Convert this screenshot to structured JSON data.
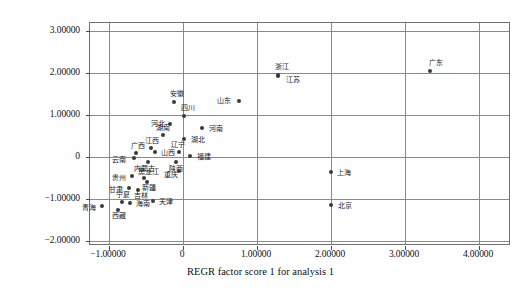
{
  "chart_data": {
    "type": "scatter",
    "title": "",
    "xlabel": "REGR factor score 1 for analysis 1",
    "ylabel": "REGR factor score 2 for analysis 1",
    "xlim": [
      -1.4,
      4.45
    ],
    "ylim": [
      -2.3,
      3.45
    ],
    "grid": true,
    "legend": null,
    "xticks": [
      {
        "value": -1,
        "label": "−1.00000"
      },
      {
        "value": 0,
        "label": "0"
      },
      {
        "value": 1,
        "label": "1.00000"
      },
      {
        "value": 2,
        "label": "2.00000"
      },
      {
        "value": 3,
        "label": "3.00000"
      },
      {
        "value": 4,
        "label": "4.00000"
      }
    ],
    "yticks": [
      {
        "value": 3,
        "label": "3.00000"
      },
      {
        "value": 2,
        "label": "2.00000"
      },
      {
        "value": 1,
        "label": "1.00000"
      },
      {
        "value": 0,
        "label": "0"
      },
      {
        "value": -1,
        "label": "−1.00000"
      },
      {
        "value": -2,
        "label": "−2.00000"
      }
    ],
    "point_color": "#3a3a3a",
    "grid_color": "#8a8a8a",
    "points": [
      {
        "label": "广东",
        "x": 3.34,
        "y": 2.05,
        "lx": -1,
        "ly": -11
      },
      {
        "label": "浙江",
        "x": 1.29,
        "y": 1.95,
        "lx": -3,
        "ly": -11
      },
      {
        "label": "江苏",
        "x": 1.28,
        "y": 1.94,
        "lx": 8,
        "ly": 1
      },
      {
        "label": "山东",
        "x": 0.75,
        "y": 1.33,
        "lx": -22,
        "ly": -3
      },
      {
        "label": "安徽",
        "x": -0.12,
        "y": 1.3,
        "lx": -4,
        "ly": -11
      },
      {
        "label": "四川",
        "x": 0.02,
        "y": 0.98,
        "lx": -3,
        "ly": -11
      },
      {
        "label": "河北",
        "x": -0.18,
        "y": 0.78,
        "lx": -19,
        "ly": -3
      },
      {
        "label": "河南",
        "x": 0.25,
        "y": 0.7,
        "lx": 7,
        "ly": -2
      },
      {
        "label": "湖南",
        "x": -0.27,
        "y": 0.52,
        "lx": -7,
        "ly": -10
      },
      {
        "label": "湖北",
        "x": 0.02,
        "y": 0.42,
        "lx": 7,
        "ly": -2
      },
      {
        "label": "江西",
        "x": -0.43,
        "y": 0.22,
        "lx": -6,
        "ly": -10
      },
      {
        "label": "山西",
        "x": -0.38,
        "y": 0.11,
        "lx": 6,
        "ly": -2
      },
      {
        "label": "辽宁",
        "x": -0.05,
        "y": 0.12,
        "lx": -8,
        "ly": -10
      },
      {
        "label": "福建",
        "x": 0.1,
        "y": 0.02,
        "lx": 7,
        "ly": -2
      },
      {
        "label": "广西",
        "x": -0.63,
        "y": 0.1,
        "lx": -5,
        "ly": -10
      },
      {
        "label": "云南",
        "x": -0.66,
        "y": -0.03,
        "lx": -22,
        "ly": -1
      },
      {
        "label": "内蒙古",
        "x": -0.47,
        "y": -0.13,
        "lx": -14,
        "ly": 4
      },
      {
        "label": "陕西",
        "x": -0.1,
        "y": -0.12,
        "lx": -7,
        "ly": 4
      },
      {
        "label": "重庆",
        "x": -0.06,
        "y": -0.33,
        "lx": -15,
        "ly": 1
      },
      {
        "label": "贵州",
        "x": -0.69,
        "y": -0.46,
        "lx": -20,
        "ly": -1
      },
      {
        "label": "黑龙江",
        "x": -0.53,
        "y": -0.5,
        "lx": -6,
        "ly": -9
      },
      {
        "label": "新疆",
        "x": -0.49,
        "y": -0.6,
        "lx": -5,
        "ly": 3
      },
      {
        "label": "甘肃",
        "x": -0.73,
        "y": -0.74,
        "lx": -20,
        "ly": -1
      },
      {
        "label": "吉林",
        "x": -0.61,
        "y": -0.79,
        "lx": -4,
        "ly": 3
      },
      {
        "label": "宁夏",
        "x": -0.83,
        "y": -1.06,
        "lx": -6,
        "ly": -10
      },
      {
        "label": "海南",
        "x": -0.72,
        "y": -1.09,
        "lx": 6,
        "ly": -2
      },
      {
        "label": "青海",
        "x": -1.09,
        "y": -1.16,
        "lx": -20,
        "ly": -1
      },
      {
        "label": "西藏",
        "x": -0.88,
        "y": -1.26,
        "lx": -6,
        "ly": 3
      },
      {
        "label": "天津",
        "x": -0.4,
        "y": -1.05,
        "lx": 6,
        "ly": -2
      },
      {
        "label": "上海",
        "x": 2.0,
        "y": -0.35,
        "lx": 6,
        "ly": -2
      },
      {
        "label": "北京",
        "x": 2.0,
        "y": -1.14,
        "lx": 7,
        "ly": -2
      }
    ]
  }
}
